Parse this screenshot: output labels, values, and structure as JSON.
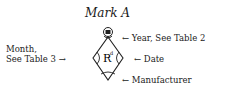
{
  "title": "Mark A",
  "mark": {
    "center_text": "R",
    "superscript": "d"
  },
  "labels": {
    "year": "← Year, See Table 2",
    "month_line1": "Month,",
    "month_line2": "See Table 3 →",
    "date": "← Date",
    "manufacturer": "← Manufacturer"
  }
}
